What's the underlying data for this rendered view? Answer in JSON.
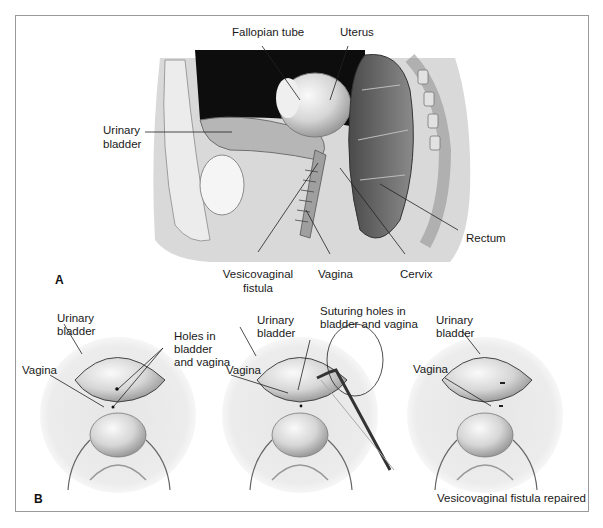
{
  "figure": {
    "panel_a": {
      "letter": "A",
      "labels": {
        "fallopian_tube": "Fallopian tube",
        "uterus": "Uterus",
        "urinary_bladder_line1": "Urinary",
        "urinary_bladder_line2": "bladder",
        "rectum": "Rectum",
        "vesicovaginal_line1": "Vesicovaginal",
        "vesicovaginal_line2": "fistula",
        "vagina": "Vagina",
        "cervix": "Cervix"
      }
    },
    "panel_b": {
      "letter": "B",
      "views": [
        {
          "bladder_line1": "Urinary",
          "bladder_line2": "bladder",
          "vagina": "Vagina",
          "note_line1": "Holes in",
          "note_line2": "bladder",
          "note_line3": "and vagina"
        },
        {
          "bladder_line1": "Urinary",
          "bladder_line2": "bladder",
          "vagina": "Vagina",
          "note_line1": "Suturing holes in",
          "note_line2": "bladder and vagina"
        },
        {
          "bladder_line1": "Urinary",
          "bladder_line2": "bladder",
          "vagina": "Vagina",
          "caption": "Vesicovaginal fistula repaired"
        }
      ]
    }
  }
}
